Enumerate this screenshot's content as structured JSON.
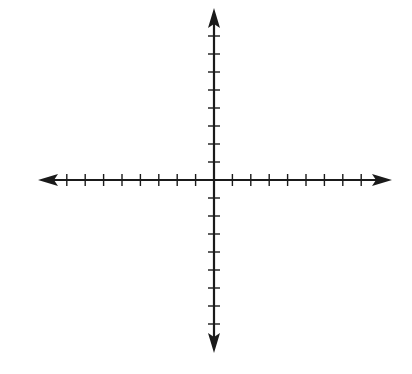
{
  "diagram": {
    "type": "cartesian-axes",
    "background": "#ffffff",
    "stroke_color": "#1a1a1a",
    "origin": {
      "x": 214,
      "y": 180
    },
    "x_axis": {
      "left_arrow_tip": 38,
      "right_arrow_tip": 392,
      "ticks_negative": 8,
      "ticks_positive": 8,
      "tick_spacing_px": 18.4,
      "labels": []
    },
    "y_axis": {
      "top_arrow_tip": 8,
      "bottom_arrow_tip": 353,
      "ticks_positive": 8,
      "ticks_negative": 8,
      "tick_spacing_px": 18,
      "labels": []
    }
  }
}
